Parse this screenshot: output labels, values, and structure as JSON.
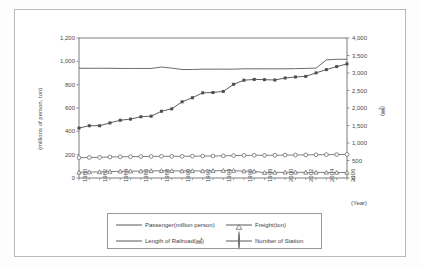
{
  "figure": {
    "frame_color": "#b9b9bc",
    "plot_border_color": "#6e6e70",
    "background": "#ffffff"
  },
  "chart_data": {
    "type": "line",
    "title": "",
    "xlabel": "(Year)",
    "ylabel_left": "(millions of person, ton)",
    "ylabel_right": "(㎣)",
    "x": [
      1980,
      1981,
      1982,
      1983,
      1984,
      1985,
      1986,
      1987,
      1988,
      1989,
      1990,
      1991,
      1992,
      1993,
      1994,
      1995,
      1996,
      1997,
      1998,
      1999,
      2000,
      2001,
      2002,
      2003,
      2004,
      2005,
      2006
    ],
    "xtick_labels": [
      "1980",
      "1982",
      "1984",
      "1986",
      "1988",
      "1990",
      "1992",
      "1994",
      "1996",
      "1998",
      "2000",
      "2002",
      "2004",
      "2006"
    ],
    "xtick_values": [
      1980,
      1982,
      1984,
      1986,
      1988,
      1990,
      1992,
      1994,
      1996,
      1998,
      2000,
      2002,
      2004,
      2006
    ],
    "ylim_left": [
      0,
      1200
    ],
    "ytick_left": [
      0,
      200,
      400,
      600,
      800,
      1000,
      1200
    ],
    "ytick_left_labels": [
      "0",
      "200",
      "400",
      "600",
      "800",
      "1,000",
      "1,200"
    ],
    "ylim_right": [
      0,
      4000
    ],
    "ytick_right": [
      0,
      500,
      1000,
      1500,
      2000,
      2500,
      3000,
      3500,
      4000
    ],
    "ytick_right_labels": [
      "0",
      "500",
      "1,000",
      "1,500",
      "2,000",
      "2,500",
      "3,000",
      "3,500",
      "4,000"
    ],
    "grid": false,
    "legend_position": "bottom",
    "series": [
      {
        "name": "Passenger(million person)",
        "axis": "left",
        "marker": "square",
        "color": "#4d4d4d",
        "values": [
          428,
          448,
          448,
          472,
          495,
          505,
          525,
          530,
          572,
          593,
          653,
          688,
          730,
          733,
          742,
          803,
          838,
          845,
          843,
          840,
          857,
          866,
          871,
          901,
          929,
          955,
          978
        ]
      },
      {
        "name": "Freight(ton)",
        "axis": "left",
        "marker": "triangle",
        "color": "#6f6f6f",
        "values": [
          49,
          51,
          52,
          55,
          57,
          58,
          59,
          61,
          62,
          61,
          60,
          61,
          60,
          62,
          63,
          63,
          59,
          57,
          46,
          48,
          49,
          49,
          48,
          48,
          48,
          47,
          47
        ]
      },
      {
        "name": "Length of Railroad(㎣)",
        "axis": "right",
        "marker": "none",
        "color": "#5a5a5a",
        "values": [
          3135,
          3135,
          3135,
          3135,
          3130,
          3130,
          3130,
          3130,
          3170,
          3140,
          3100,
          3100,
          3110,
          3110,
          3110,
          3110,
          3120,
          3120,
          3120,
          3120,
          3120,
          3125,
          3130,
          3140,
          3375,
          3392,
          3392
        ]
      },
      {
        "name": "Number of Station",
        "axis": "left",
        "marker": "circle",
        "color": "#6f6f6f",
        "values": [
          174,
          176,
          177,
          180,
          182,
          183,
          184,
          185,
          186,
          186,
          186,
          187,
          188,
          189,
          190,
          192,
          194,
          195,
          194,
          195,
          196,
          197,
          198,
          199,
          200,
          201,
          202
        ]
      }
    ]
  },
  "legend": {
    "entries": [
      {
        "label": "Passenger(million person)",
        "marker": "square"
      },
      {
        "label": "Freight(ton)",
        "marker": "triangle"
      },
      {
        "label": "Length of Railroad(㎣)",
        "marker": "line"
      },
      {
        "label": "Number of Station",
        "marker": "circle"
      }
    ]
  }
}
